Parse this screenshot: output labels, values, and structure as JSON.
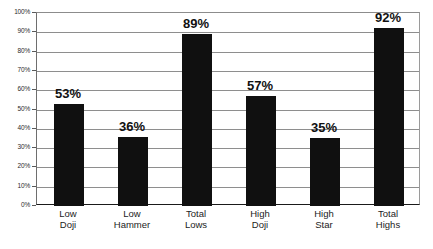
{
  "chart_data": {
    "type": "bar",
    "title": "",
    "subtitle": "",
    "xlabel": "",
    "ylabel": "",
    "categories": [
      "Low Doji",
      "Low Hammer",
      "Total Lows",
      "High Doji",
      "High Star",
      "Total Highs"
    ],
    "category_lines": [
      [
        "Low",
        "Doji"
      ],
      [
        "Low",
        "Hammer"
      ],
      [
        "Total",
        "Lows"
      ],
      [
        "High",
        "Doji"
      ],
      [
        "High",
        "Star"
      ],
      [
        "Total",
        "Highs"
      ]
    ],
    "values": [
      53,
      36,
      89,
      57,
      35,
      92
    ],
    "value_labels": [
      "53%",
      "36%",
      "89%",
      "57%",
      "35%",
      "92%"
    ],
    "ylim": [
      0,
      100
    ],
    "ytick_values": [
      0,
      10,
      20,
      30,
      40,
      50,
      60,
      70,
      80,
      90,
      100
    ],
    "ytick_labels": [
      "0%",
      "10%",
      "20%",
      "30%",
      "40%",
      "50%",
      "60%",
      "70%",
      "80%",
      "90%",
      "100%"
    ],
    "grid": true,
    "legend": "none",
    "bar_color": "#101010",
    "gridline_color": "#8e8e8e",
    "axis_color": "#1a1a1a",
    "background_color": "#ffffff",
    "label_color": "#111111"
  }
}
